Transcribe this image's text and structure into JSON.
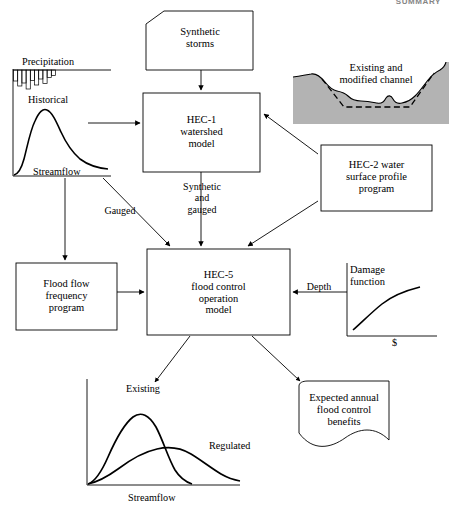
{
  "page": {
    "header_text": "SUMMARY",
    "width": 449,
    "height": 513,
    "background": "#ffffff",
    "ink": "#000000",
    "channel_fill": "#b3b3b3"
  },
  "nodes": {
    "synthetic_storms": {
      "label": "Synthetic\nstorms",
      "shape": "cut-corner-box"
    },
    "hec1": {
      "label": "HEC-1\nwatershed\nmodel",
      "shape": "rectangle"
    },
    "hec2": {
      "label": "HEC-2 water\nsurface profile\nprogram",
      "shape": "rectangle"
    },
    "hec5": {
      "label": "HEC-5\nflood control\noperation\nmodel",
      "shape": "rectangle"
    },
    "flood_flow_frequency": {
      "label": "Flood flow\nfrequency\nprogram",
      "shape": "rectangle"
    },
    "expected_benefits": {
      "label": "Expected annual\nflood control\nbenefits",
      "shape": "document"
    }
  },
  "edge_labels": {
    "gauged": "Gauged",
    "synthetic_and_gauged": "Synthetic\nand\ngauged",
    "depth": "Depth"
  },
  "charts": [
    {
      "id": "historical-hydrograph",
      "type": "line",
      "title": "",
      "series_labels": [
        "Precipitation",
        "Historical"
      ],
      "annotations": [
        "Precipitation",
        "Historical",
        "Streamflow"
      ],
      "xlabel": "Streamflow",
      "ylabel": "",
      "grid": false,
      "legend": "inline-annotation",
      "precipitation_bars": [
        3.2,
        6.0,
        4.2,
        7.4,
        3.0,
        5.6,
        2.6,
        4.6,
        2.0,
        1.4
      ],
      "hydrograph_x": [
        0,
        4,
        8,
        12,
        16,
        20,
        24,
        30,
        36,
        44,
        52,
        62,
        74,
        86,
        100
      ],
      "hydrograph_y": [
        0,
        1,
        3,
        10,
        28,
        55,
        74,
        86,
        80,
        66,
        52,
        40,
        30,
        24,
        20
      ]
    },
    {
      "id": "channel-cross-section",
      "type": "area",
      "title": "Existing and\nmodified channel",
      "annotations": [
        "Existing and modified channel"
      ],
      "series": [
        {
          "name": "existing channel",
          "style": "solid"
        },
        {
          "name": "modified channel",
          "style": "dashed"
        }
      ],
      "grid": false
    },
    {
      "id": "damage-function",
      "type": "line",
      "title": "Damage\nfunction",
      "xlabel": "$",
      "ylabel": "Depth",
      "annotations": [
        "Damage function",
        "$",
        "Depth"
      ],
      "x": [
        0,
        10,
        22,
        36,
        52,
        70,
        88,
        100
      ],
      "y": [
        0,
        22,
        40,
        55,
        67,
        77,
        84,
        88
      ],
      "grid": false
    },
    {
      "id": "existing-vs-regulated-hydrograph",
      "type": "line",
      "title": "",
      "xlabel": "Streamflow",
      "ylabel": "",
      "grid": false,
      "annotations": [
        "Existing",
        "Regulated",
        "Streamflow"
      ],
      "series": [
        {
          "name": "Existing",
          "x": [
            0,
            6,
            14,
            22,
            30,
            38,
            46,
            54,
            62,
            70,
            78
          ],
          "y": [
            0,
            6,
            26,
            55,
            80,
            92,
            88,
            70,
            45,
            22,
            6
          ]
        },
        {
          "name": "Regulated",
          "x": [
            0,
            8,
            18,
            28,
            40,
            52,
            64,
            76,
            88,
            100
          ],
          "y": [
            0,
            4,
            14,
            28,
            43,
            53,
            55,
            48,
            32,
            14
          ]
        }
      ]
    }
  ]
}
